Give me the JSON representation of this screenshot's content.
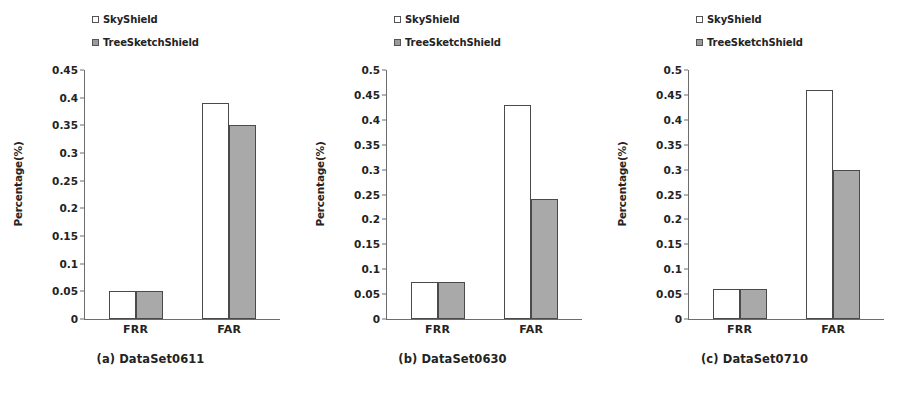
{
  "figure": {
    "panel_count": 3,
    "series_names": [
      "SkyShield",
      "TreeSketchShield"
    ],
    "colors": {
      "skyshield_fill": "#ffffff",
      "treesketchshield_fill": "#a9a9a9",
      "bar_outline": "#4a4a4a",
      "axis": "#6d6d6d",
      "text": "#232323"
    }
  },
  "legend": {
    "skyshield_label": "SkyShield",
    "treesketchshield_label": "TreeSketchShield"
  },
  "panels": [
    {
      "caption": "(a)  DataSet0611",
      "ylabel": "Percentage(%)",
      "ticks": [
        "0",
        "0.05",
        "0.1",
        "0.15",
        "0.2",
        "0.25",
        "0.3",
        "0.35",
        "0.4",
        "0.45"
      ],
      "xticks": [
        "FRR",
        "FAR"
      ]
    },
    {
      "caption": "(b)  DataSet0630",
      "ylabel": "Percentage(%)",
      "ticks": [
        "0",
        "0.05",
        "0.1",
        "0.15",
        "0.2",
        "0.25",
        "0.3",
        "0.35",
        "0.4",
        "0.45",
        "0.5"
      ],
      "xticks": [
        "FRR",
        "FAR"
      ]
    },
    {
      "caption": "(c)  DataSet0710",
      "ylabel": "Percentage(%)",
      "ticks": [
        "0",
        "0.05",
        "0.1",
        "0.15",
        "0.2",
        "0.25",
        "0.3",
        "0.35",
        "0.4",
        "0.45",
        "0.5"
      ],
      "xticks": [
        "FRR",
        "FAR"
      ]
    }
  ],
  "chart_data": [
    {
      "type": "bar",
      "title": "(a)  DataSet0611",
      "categories": [
        "FRR",
        "FAR"
      ],
      "series": [
        {
          "name": "SkyShield",
          "values": [
            0.05,
            0.39
          ]
        },
        {
          "name": "TreeSketchShield",
          "values": [
            0.05,
            0.35
          ]
        }
      ],
      "xlabel": "",
      "ylabel": "Percentage(%)",
      "ylim": [
        0,
        0.45
      ],
      "ytick_step": 0.05,
      "grid": false,
      "legend_position": "top-left"
    },
    {
      "type": "bar",
      "title": "(b)  DataSet0630",
      "categories": [
        "FRR",
        "FAR"
      ],
      "series": [
        {
          "name": "SkyShield",
          "values": [
            0.075,
            0.43
          ]
        },
        {
          "name": "TreeSketchShield",
          "values": [
            0.075,
            0.24
          ]
        }
      ],
      "xlabel": "",
      "ylabel": "Percentage(%)",
      "ylim": [
        0,
        0.5
      ],
      "ytick_step": 0.05,
      "grid": false,
      "legend_position": "top-left"
    },
    {
      "type": "bar",
      "title": "(c)  DataSet0710",
      "categories": [
        "FRR",
        "FAR"
      ],
      "series": [
        {
          "name": "SkyShield",
          "values": [
            0.06,
            0.46
          ]
        },
        {
          "name": "TreeSketchShield",
          "values": [
            0.06,
            0.3
          ]
        }
      ],
      "xlabel": "",
      "ylabel": "Percentage(%)",
      "ylim": [
        0,
        0.5
      ],
      "ytick_step": 0.05,
      "grid": false,
      "legend_position": "top-left"
    }
  ]
}
